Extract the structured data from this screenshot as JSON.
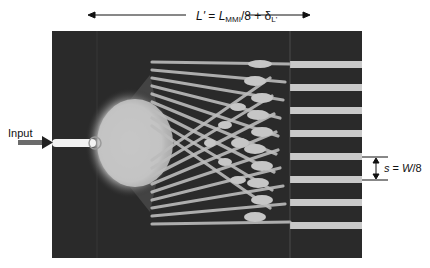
{
  "figure": {
    "title_equation": {
      "lhs": "L'",
      "equals": " = ",
      "L": "L",
      "L_sub": "MMI",
      "div": "/8 + δ",
      "delta_sub": "L'"
    },
    "input_label": "Input",
    "spacing_label": {
      "s": "s",
      "eq": " = ",
      "W": "W",
      "frac": "/8"
    },
    "num_outputs": 8,
    "colors": {
      "background": "#ffffff",
      "mmi_dark": "#2a2a2a",
      "light_field": "#c8c8c8",
      "input_core": "#f2f2f2",
      "input_arrow": "#6b6b6b",
      "annotation": "#111111"
    },
    "geometry": {
      "mmi_rect": {
        "x": 52,
        "y": 31,
        "width": 310,
        "height": 227
      },
      "input_waveguide_y": 143,
      "output_ys": [
        64,
        87,
        110,
        133,
        156,
        179,
        202,
        225
      ],
      "output_spacing_px": 23
    }
  }
}
